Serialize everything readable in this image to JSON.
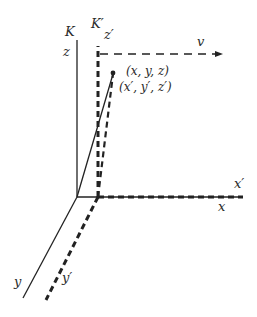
{
  "diagram": {
    "frames": {
      "K": {
        "label": "K",
        "axis_z": "z",
        "axis_x": "x",
        "axis_y": "y"
      },
      "K_prime": {
        "label": "K′",
        "axis_z": "z′",
        "axis_x": "x′",
        "axis_y": "y′"
      }
    },
    "velocity_label": "v",
    "point_labels": {
      "unprimed": "(x, y, z)",
      "primed": "(x′, y′, z′)"
    },
    "colors": {
      "stroke": "#222222",
      "background": "#ffffff"
    }
  }
}
